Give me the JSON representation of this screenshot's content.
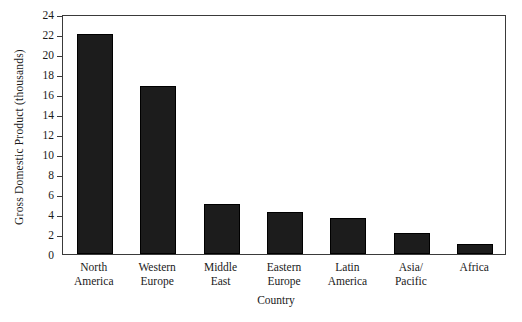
{
  "chart_data": {
    "type": "bar",
    "title": "",
    "xlabel": "Country",
    "ylabel": "Gross Domestic Product (thousands)",
    "categories": [
      "North America",
      "Western Europe",
      "Middle East",
      "Eastern Europe",
      "Latin America",
      "Asia/ Pacific",
      "Africa"
    ],
    "category_lines": [
      [
        "North",
        "America"
      ],
      [
        "Western",
        "Europe"
      ],
      [
        "Middle",
        "East"
      ],
      [
        "Eastern",
        "Europe"
      ],
      [
        "Latin",
        "America"
      ],
      [
        "Asia/",
        "Pacific"
      ],
      [
        "Africa"
      ]
    ],
    "values": [
      22.0,
      16.8,
      5.0,
      4.2,
      3.6,
      2.1,
      1.0
    ],
    "ylim": [
      0,
      24
    ],
    "yticks": [
      0,
      2,
      4,
      6,
      8,
      10,
      12,
      14,
      16,
      18,
      20,
      22,
      24
    ],
    "ytick_labels": [
      "0",
      "2",
      "4",
      "6",
      "8",
      "10",
      "12",
      "14",
      "16",
      "18",
      "20",
      "22",
      "24"
    ],
    "grid": false,
    "legend": false,
    "bar_color": "#1c1c1c",
    "axis_color": "#3a3a3a",
    "background": "#ffffff"
  }
}
